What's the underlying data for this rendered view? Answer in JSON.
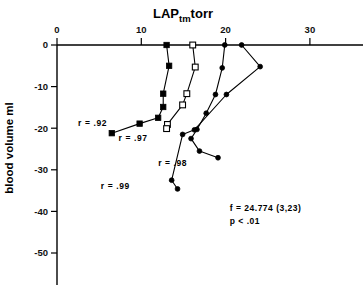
{
  "chart_data": {
    "type": "line",
    "title_main": "LAP",
    "title_sub": "tm",
    "title_unit": "torr",
    "xlabel": "LAPtm  torr",
    "ylabel": "blood volume ml",
    "xlim": [
      0,
      34
    ],
    "ylim": [
      -55,
      2
    ],
    "xticks": [
      0,
      10,
      20,
      30
    ],
    "xtick_labels": [
      "0",
      "10",
      "20",
      "30"
    ],
    "yticks": [
      0,
      -10,
      -20,
      -30,
      -40,
      -50
    ],
    "ytick_labels": [
      "0",
      "-10",
      "-20",
      "-30",
      "-40",
      "-50"
    ],
    "grid": false,
    "legend": "none",
    "xaxis_position": "top",
    "annotations": [
      {
        "text": "r = .92",
        "x": 2.5,
        "y": -19.5
      },
      {
        "text": "r = .97",
        "x": 7.3,
        "y": -23.0
      },
      {
        "text": "r = .98",
        "x": 12.0,
        "y": -29.0
      },
      {
        "text": "r = .99",
        "x": 5.2,
        "y": -34.5
      },
      {
        "text": "f = 24.774  (3,23)",
        "x": 20.5,
        "y": -40.0
      },
      {
        "text": "p < .01",
        "x": 20.5,
        "y": -43.0
      }
    ],
    "stats": {
      "f_value": "f = 24.774  (3,23)",
      "p_value": "p < .01"
    },
    "series": [
      {
        "name": "r = .92",
        "label": "r = .92",
        "marker": "filled-square",
        "r": 0.92,
        "points": [
          {
            "x": 13.0,
            "y": 0.0
          },
          {
            "x": 13.3,
            "y": -5.0
          },
          {
            "x": 12.6,
            "y": -11.7
          },
          {
            "x": 12.6,
            "y": -14.9
          },
          {
            "x": 12.0,
            "y": -17.5
          },
          {
            "x": 9.8,
            "y": -18.9
          },
          {
            "x": 6.5,
            "y": -21.2
          }
        ]
      },
      {
        "name": "r = .97",
        "label": "r = .97",
        "marker": "open-square",
        "r": 0.97,
        "points": [
          {
            "x": 16.1,
            "y": 0.0
          },
          {
            "x": 16.4,
            "y": -5.3
          },
          {
            "x": 15.4,
            "y": -11.7
          },
          {
            "x": 14.9,
            "y": -14.4
          },
          {
            "x": 13.1,
            "y": -19.1
          },
          {
            "x": 13.0,
            "y": -20.1
          }
        ]
      },
      {
        "name": "r = .98",
        "label": "r = .98",
        "marker": "dot",
        "r": 0.98,
        "points": [
          {
            "x": 19.9,
            "y": 0.0
          },
          {
            "x": 19.6,
            "y": -5.5
          },
          {
            "x": 18.8,
            "y": -11.9
          },
          {
            "x": 17.7,
            "y": -16.4
          },
          {
            "x": 16.6,
            "y": -20.3
          },
          {
            "x": 15.9,
            "y": -22.5
          },
          {
            "x": 16.9,
            "y": -25.5
          },
          {
            "x": 19.1,
            "y": -27.1
          }
        ]
      },
      {
        "name": "r = .99",
        "label": "r = .99",
        "marker": "dot",
        "r": 0.99,
        "points": [
          {
            "x": 21.9,
            "y": 0.0
          },
          {
            "x": 24.1,
            "y": -5.2
          },
          {
            "x": 20.1,
            "y": -11.9
          },
          {
            "x": 16.3,
            "y": -20.4
          },
          {
            "x": 14.9,
            "y": -21.5
          },
          {
            "x": 13.6,
            "y": -32.5
          },
          {
            "x": 14.3,
            "y": -34.6
          }
        ]
      }
    ]
  }
}
